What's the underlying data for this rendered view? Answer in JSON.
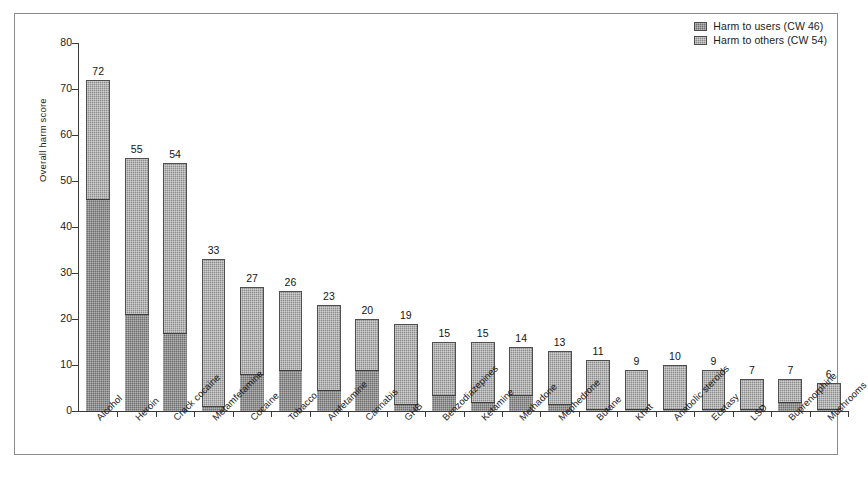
{
  "chart_data": {
    "type": "bar",
    "stacked": true,
    "title": "",
    "xlabel": "",
    "ylabel": "Overall harm score",
    "ylim": [
      0,
      80
    ],
    "yticks": [
      0,
      10,
      20,
      30,
      40,
      50,
      60,
      70,
      80
    ],
    "grid": false,
    "legend_position": "top-right",
    "series": [
      {
        "name": "Harm to users (CW 46)",
        "key": "users",
        "color": "#6f6f6f"
      },
      {
        "name": "Harm to others (CW 54)",
        "key": "others",
        "color": "#8d8d8d"
      }
    ],
    "categories": [
      "Alcohol",
      "Heroin",
      "Crack cocaine",
      "Metamfetamine",
      "Cocaine",
      "Tobacco",
      "Amfetamine",
      "Cannabis",
      "GHB",
      "Benzodiazepines",
      "Ketamine",
      "Methadone",
      "Mephedrone",
      "Butane",
      "Khat",
      "Anabolic steroids",
      "Ecstasy",
      "LSD",
      "Buprenorphine",
      "Mushrooms"
    ],
    "totals": [
      72,
      55,
      54,
      33,
      27,
      26,
      23,
      20,
      19,
      15,
      15,
      14,
      13,
      11,
      9,
      10,
      9,
      7,
      7,
      6
    ],
    "users_values": [
      46,
      21,
      17,
      1,
      8,
      9,
      4.5,
      9,
      1.5,
      3.5,
      2,
      3.5,
      1.5,
      0.5,
      0.5,
      0.5,
      0.5,
      0.5,
      2,
      0.5
    ],
    "others_values": [
      26,
      34,
      37,
      32,
      19,
      17,
      18.5,
      11,
      17.5,
      11.5,
      13,
      10.5,
      11.5,
      10.5,
      8.5,
      9.5,
      8.5,
      6.5,
      5,
      5.5
    ],
    "bar_labels": [
      "72",
      "55",
      "54",
      "33",
      "27",
      "26",
      "23",
      "20",
      "19",
      "15",
      "15",
      "14",
      "13",
      "11",
      "9",
      "10",
      "9",
      "7",
      "7",
      "6"
    ]
  },
  "axis": {
    "y_title": "Overall harm score",
    "y_tick_labels": [
      "0",
      "10",
      "20",
      "30",
      "40",
      "50",
      "60",
      "70",
      "80"
    ]
  },
  "legend": {
    "items": [
      {
        "label": "Harm to users (CW 46)"
      },
      {
        "label": "Harm to others (CW 54)"
      }
    ]
  }
}
